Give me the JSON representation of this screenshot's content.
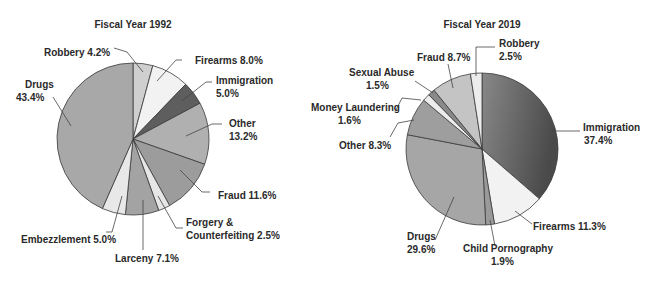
{
  "chart_data": [
    {
      "type": "pie",
      "title": "Fiscal Year 1992",
      "center": [
        133,
        139
      ],
      "radius": 76,
      "slices": [
        {
          "name": "Robbery",
          "value": 4.2,
          "label": "Robbery 4.2%",
          "color": "#cfcfcf"
        },
        {
          "name": "Firearms",
          "value": 8.0,
          "label": "Firearms 8.0%",
          "color": "#f2f2f2"
        },
        {
          "name": "Immigration",
          "value": 5.0,
          "label": "Immigration 5.0%",
          "color": "#5e5e5e"
        },
        {
          "name": "Other",
          "value": 13.2,
          "label": "Other 13.2%",
          "color": "#b0b0b0"
        },
        {
          "name": "Fraud",
          "value": 11.6,
          "label": "Fraud 11.6%",
          "color": "#9c9c9c"
        },
        {
          "name": "Forgery & Counterfeiting",
          "value": 2.5,
          "label": "Forgery & Counterfeiting 2.5%",
          "color": "#e6e6e6"
        },
        {
          "name": "Larceny",
          "value": 7.1,
          "label": "Larceny 7.1%",
          "color": "#a3a3a3"
        },
        {
          "name": "Embezzlement",
          "value": 5.0,
          "label": "Embezzlement 5.0%",
          "color": "#e8e8e8"
        },
        {
          "name": "Drugs",
          "value": 43.4,
          "label": "Drugs 43.4%",
          "color": "#a8a8a8"
        }
      ]
    },
    {
      "type": "pie",
      "title": "Fiscal Year 2019",
      "center": [
        482,
        149
      ],
      "radius": 76,
      "slices": [
        {
          "name": "Immigration",
          "value": 37.4,
          "label": "Immigration 37.4%",
          "color": "#6e6e6e"
        },
        {
          "name": "Firearms",
          "value": 11.3,
          "label": "Firearms 11.3%",
          "color": "#f2f2f2"
        },
        {
          "name": "Child Pornography",
          "value": 1.9,
          "label": "Child Pornography 1.9%",
          "color": "#9a9a9a"
        },
        {
          "name": "Drugs",
          "value": 29.6,
          "label": "Drugs 29.6%",
          "color": "#a6a6a6"
        },
        {
          "name": "Other",
          "value": 8.3,
          "label": "Other 8.3%",
          "color": "#9e9e9e"
        },
        {
          "name": "Money Laundering",
          "value": 1.6,
          "label": "Money Laundering 1.6%",
          "color": "#ececec"
        },
        {
          "name": "Sexual Abuse",
          "value": 1.5,
          "label": "Sexual Abuse 1.5%",
          "color": "#8a8a8a"
        },
        {
          "name": "Fraud",
          "value": 8.7,
          "label": "Fraud 8.7%",
          "color": "#c4c4c4"
        },
        {
          "name": "Robbery",
          "value": 2.5,
          "label": "Robbery 2.5%",
          "color": "#ececec"
        }
      ]
    }
  ],
  "labels": {
    "left": {
      "title": "Fiscal Year 1992",
      "robbery": "Robbery 4.2%",
      "firearms": "Firearms 8.0%",
      "immigration_1": "Immigration",
      "immigration_2": "5.0%",
      "drugs_1": "Drugs",
      "drugs_2": "43.4%",
      "other_1": "Other",
      "other_2": "13.2%",
      "fraud": "Fraud 11.6%",
      "forgery_1": "Forgery &",
      "forgery_2": "Counterfeiting 2.5%",
      "embezzlement": "Embezzlement 5.0%",
      "larceny": "Larceny 7.1%"
    },
    "right": {
      "title": "Fiscal Year 2019",
      "fraud": "Fraud 8.7%",
      "robbery_1": "Robbery",
      "robbery_2": "2.5%",
      "sexual_1": "Sexual Abuse",
      "sexual_2": "1.5%",
      "money_1": "Money Laundering",
      "money_2": "1.6%",
      "other": "Other 8.3%",
      "immigration_1": "Immigration",
      "immigration_2": "37.4%",
      "drugs_1": "Drugs",
      "drugs_2": "29.6%",
      "child_1": "Child Pornography",
      "child_2": "1.9%",
      "firearms": "Firearms 11.3%"
    }
  }
}
